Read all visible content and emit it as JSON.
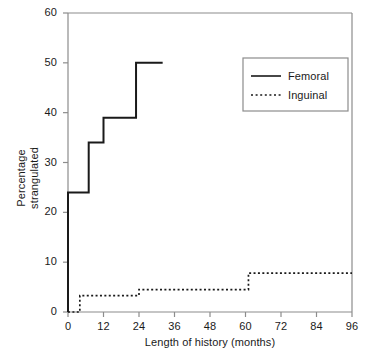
{
  "chart_data": {
    "type": "line",
    "subtype": "step",
    "title": "",
    "xlabel": "Length of history (months)",
    "ylabel": "Percentage strangulated",
    "ylabel_lines": [
      "Percentage",
      "strangulated"
    ],
    "xlim": [
      0,
      96
    ],
    "ylim": [
      0,
      60
    ],
    "xticks": [
      0,
      12,
      24,
      36,
      48,
      60,
      72,
      84,
      96
    ],
    "yticks": [
      0,
      10,
      20,
      30,
      40,
      50,
      60
    ],
    "xtick_labels": [
      "0",
      "12",
      "24",
      "36",
      "48",
      "60",
      "72",
      "84",
      "96"
    ],
    "ytick_labels": [
      "0",
      "10",
      "20",
      "30",
      "40",
      "50",
      "60"
    ],
    "grid": false,
    "legend_position": "upper-right",
    "series": [
      {
        "name": "Femoral",
        "style": "solid",
        "color": "#1a1a1a",
        "x": [
          0,
          0,
          7,
          7,
          12,
          12,
          23,
          23,
          32
        ],
        "y": [
          0,
          24,
          24,
          34,
          34,
          39,
          39,
          50,
          50
        ],
        "steps": [
          {
            "x": 0,
            "y": 24
          },
          {
            "x": 7,
            "y": 34
          },
          {
            "x": 12,
            "y": 39
          },
          {
            "x": 23,
            "y": 50
          },
          {
            "x": 32,
            "y": 50
          }
        ]
      },
      {
        "name": "Inguinal",
        "style": "dotted",
        "color": "#1a1a1a",
        "x": [
          0,
          1,
          2,
          3,
          4,
          24,
          24,
          61,
          61,
          96
        ],
        "y": [
          0,
          1.2,
          2.2,
          2.9,
          3.3,
          3.3,
          4.5,
          4.5,
          7.8,
          7.8
        ],
        "steps": [
          {
            "x": 0,
            "y": 0
          },
          {
            "x": 4,
            "y": 3.3
          },
          {
            "x": 24,
            "y": 4.5
          },
          {
            "x": 61,
            "y": 7.8
          },
          {
            "x": 96,
            "y": 7.8
          }
        ]
      }
    ]
  },
  "legend": {
    "entries": [
      {
        "label": "Femoral",
        "style": "solid"
      },
      {
        "label": "Inguinal",
        "style": "dotted"
      }
    ]
  },
  "colors": {
    "axis": "#8c8c8c",
    "data": "#1a1a1a",
    "text": "#1a1a1a",
    "background": "#ffffff"
  }
}
